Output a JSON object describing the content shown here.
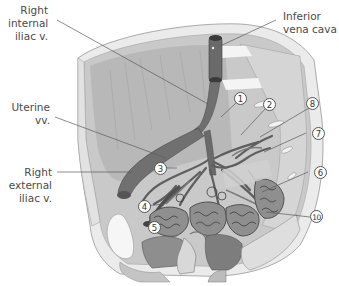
{
  "diagram": {
    "colors": {
      "background": "#ffffff",
      "pelvic_wall_outer": "#d9d9d9",
      "pelvic_wall_rim": "#ebebeb",
      "pelvic_wall_inner": "#bdbdbd",
      "vein_fill": "#6f6f6f",
      "vein_dark": "#4f4f4f",
      "organ_light": "#e6e6e6",
      "organ_mid": "#a9a9a9",
      "label_text": "#4a4a4a",
      "leader_line": "#5a5a5a"
    },
    "labels": {
      "right_internal_iliac": [
        "Right",
        "internal",
        "iliac v."
      ],
      "uterine": [
        "Uterine",
        "vv."
      ],
      "right_external_iliac": [
        "Right",
        "external",
        "iliac v."
      ],
      "inferior_vena_cava": [
        "Inferior",
        "vena cava"
      ]
    },
    "callouts": [
      {
        "n": "1"
      },
      {
        "n": "2"
      },
      {
        "n": "3"
      },
      {
        "n": "4"
      },
      {
        "n": "5"
      },
      {
        "n": "6"
      },
      {
        "n": "7"
      },
      {
        "n": "8"
      },
      {
        "n": "10"
      }
    ]
  }
}
